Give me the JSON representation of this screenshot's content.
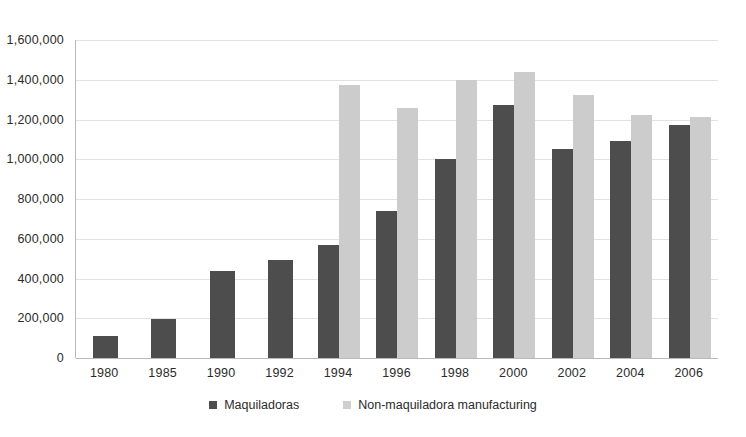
{
  "chart_data": {
    "type": "bar",
    "title": "",
    "xlabel": "",
    "ylabel": "",
    "ylim": [
      0,
      1600000
    ],
    "ytick_step": 200000,
    "grid": true,
    "legend_position": "bottom-center",
    "categories": [
      "1980",
      "1985",
      "1990",
      "1992",
      "1994",
      "1996",
      "1998",
      "2000",
      "2002",
      "2004",
      "2006"
    ],
    "ytick_labels": [
      "1,600,000",
      "1,400,000",
      "1,200,000",
      "1,000,000",
      "800,000",
      "600,000",
      "400,000",
      "200,000",
      "0"
    ],
    "ytick_values": [
      1600000,
      1400000,
      1200000,
      1000000,
      800000,
      600000,
      400000,
      200000,
      0
    ],
    "series": [
      {
        "name": "Maquiladoras",
        "color": "#4d4d4d",
        "values": [
          110000,
          198000,
          437000,
          495000,
          567000,
          740000,
          1000000,
          1275000,
          1050000,
          1090000,
          1170000
        ]
      },
      {
        "name": "Non-maquiladora manufacturing",
        "color": "#cccccc",
        "values": [
          null,
          null,
          null,
          null,
          1375000,
          1260000,
          1400000,
          1440000,
          1325000,
          1225000,
          1215000
        ]
      }
    ]
  },
  "legend": {
    "items": [
      {
        "label": "Maquiladoras",
        "swatch": "dark"
      },
      {
        "label": "Non-maquiladora manufacturing",
        "swatch": "light"
      }
    ]
  },
  "colors": {
    "maquiladoras": "#4d4d4d",
    "non_maquiladora": "#cccccc",
    "gridline": "#e2e2e2",
    "axis": "#b9b9b9",
    "text": "#2b2b2b",
    "background": "#ffffff"
  }
}
